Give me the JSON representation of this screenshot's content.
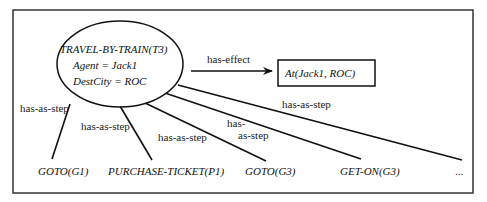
{
  "diagram": {
    "frame_color": "#333333",
    "line_color": "#111111",
    "root_node": {
      "title": "TRAVEL-BY-TRAIN(T3)",
      "attr1": "Agent = Jack1",
      "attr2": "DestCity = ROC"
    },
    "effect_edge": {
      "label": "has-effect"
    },
    "effect_node": {
      "label": "At(Jack1, ROC)"
    },
    "step_edges": [
      {
        "label": "has-as-step"
      },
      {
        "label": "has-as-step"
      },
      {
        "label": "has-as-step"
      },
      {
        "label_line1": "has-",
        "label_line2": "as-step"
      },
      {
        "label": "has-as-step"
      }
    ],
    "step_nodes": [
      {
        "label": "GOTO(G1)"
      },
      {
        "label": "PURCHASE-TICKET(P1)"
      },
      {
        "label": "GOTO(G3)"
      },
      {
        "label": "GET-ON(G3)"
      },
      {
        "label": "..."
      }
    ]
  }
}
